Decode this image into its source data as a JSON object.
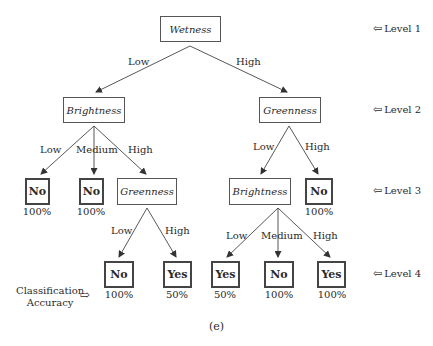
{
  "tree": {
    "root": {
      "label": "Wetness"
    },
    "level2": {
      "left": {
        "label": "Brightness"
      },
      "right": {
        "label": "Greenness"
      }
    },
    "level3": {
      "b_low": {
        "label": "No",
        "accuracy": "100%"
      },
      "b_medium": {
        "label": "No",
        "accuracy": "100%"
      },
      "b_high": {
        "label": "Greenness"
      },
      "g_low": {
        "label": "Brightness"
      },
      "g_high": {
        "label": "No",
        "accuracy": "100%"
      }
    },
    "level4": {
      "gg_low": {
        "label": "No",
        "accuracy": "100%"
      },
      "gg_high": {
        "label": "Yes",
        "accuracy": "50%"
      },
      "bb_low": {
        "label": "Yes",
        "accuracy": "50%"
      },
      "bb_medium": {
        "label": "No",
        "accuracy": "100%"
      },
      "bb_high": {
        "label": "Yes",
        "accuracy": "100%"
      }
    },
    "edges": {
      "root_low": "Low",
      "root_high": "High",
      "b_low": "Low",
      "b_medium": "Medium",
      "b_high": "High",
      "g_low": "Low",
      "g_high": "High",
      "gg_low": "Low",
      "gg_high": "High",
      "bb_low": "Low",
      "bb_medium": "Medium",
      "bb_high": "High"
    }
  },
  "levels": [
    "Level 1",
    "Level 2",
    "Level 3",
    "Level 4"
  ],
  "level_arrow_icon": "⇦",
  "accuracy_label_line1": "Classification",
  "accuracy_label_line2": "Accuracy",
  "accuracy_arrow_icon": "⇨",
  "caption": "(e)"
}
